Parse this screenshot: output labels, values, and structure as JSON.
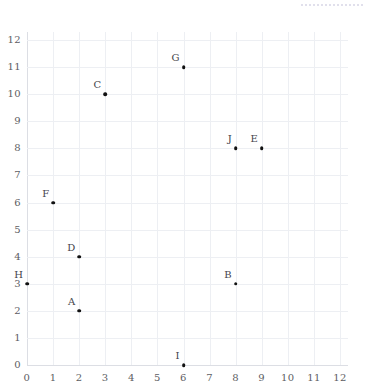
{
  "chart_data": {
    "type": "scatter",
    "title": "",
    "subtitle": "",
    "xlabel": "",
    "ylabel": "",
    "xlim": [
      0,
      12
    ],
    "ylim": [
      0,
      12
    ],
    "grid": true,
    "legend": false,
    "legend_position": "none",
    "x_ticks": [
      "0",
      "1",
      "2",
      "3",
      "4",
      "5",
      "6",
      "7",
      "8",
      "9",
      "10",
      "11",
      "12"
    ],
    "y_ticks": [
      "0",
      "1",
      "2",
      "3",
      "4",
      "5",
      "6",
      "7",
      "8",
      "9",
      "10",
      "11",
      "12"
    ],
    "point_color": "#111111",
    "grid_color": "#edeff3",
    "axis_color": "#dcdee4",
    "label_color": "#44444a",
    "tick_color": "#5d5d63",
    "points": [
      {
        "label": "A",
        "x": 2,
        "y": 2
      },
      {
        "label": "B",
        "x": 8,
        "y": 3
      },
      {
        "label": "C",
        "x": 3,
        "y": 10
      },
      {
        "label": "D",
        "x": 2,
        "y": 4
      },
      {
        "label": "E",
        "x": 9,
        "y": 8
      },
      {
        "label": "F",
        "x": 1,
        "y": 6
      },
      {
        "label": "G",
        "x": 6,
        "y": 11
      },
      {
        "label": "H",
        "x": 0,
        "y": 3
      },
      {
        "label": "I",
        "x": 6,
        "y": 0
      },
      {
        "label": "J",
        "x": 8,
        "y": 8
      }
    ]
  },
  "decor": {
    "top_artifact_color": "#d8d6e6"
  }
}
